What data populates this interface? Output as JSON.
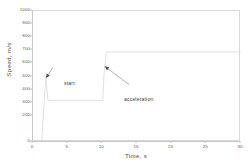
{
  "chart_data": {
    "type": "line",
    "title": "",
    "xlabel": "Time, s",
    "ylabel": "Speed, m/s",
    "xlim": [
      0,
      30
    ],
    "ylim": [
      0,
      1000
    ],
    "grid": false,
    "legend": null,
    "xticks": [
      "0",
      "5",
      "10",
      "15",
      "20",
      "25",
      "30"
    ],
    "xtick_values": [
      0,
      5,
      10,
      15,
      20,
      25,
      30
    ],
    "yticks": [
      "0",
      "200",
      "300",
      "400",
      "500",
      "600",
      "700",
      "800",
      "900",
      "1000"
    ],
    "ytick_values": [
      0,
      200,
      300,
      400,
      500,
      600,
      700,
      800,
      900,
      1000
    ],
    "series": [
      {
        "name": "speed",
        "color": "#dcdcdc",
        "x": [
          1.4,
          1.7,
          2.0,
          2.1,
          2.3,
          10.2,
          10.4,
          10.7,
          30.0
        ],
        "y": [
          0,
          250,
          480,
          430,
          310,
          310,
          520,
          680,
          680
        ]
      }
    ],
    "annotations": [
      {
        "name": "start",
        "text": "start",
        "point_x": 2.0,
        "point_y": 480,
        "label_x": 3.0,
        "label_y": 560
      },
      {
        "name": "acceleration",
        "text": "acceleration",
        "point_x": 10.5,
        "point_y": 570,
        "label_x": 14.0,
        "label_y": 430
      }
    ]
  },
  "axes": {
    "x_title": "Time, s",
    "y_title": "Speed, m/s"
  },
  "colors": {
    "curve": "#dcdcdc",
    "frame": "#d9d9d9",
    "text": "#4a4a4a",
    "annotation_arrow": "#555555"
  }
}
